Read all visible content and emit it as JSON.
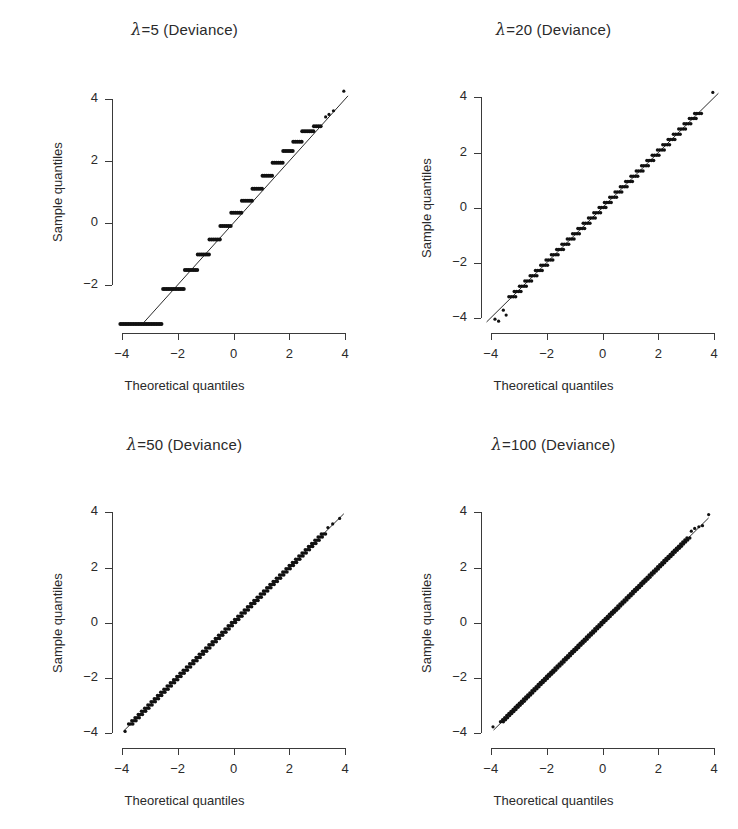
{
  "figure": {
    "width": 738,
    "height": 829,
    "background": "#ffffff",
    "ink": "#2a2a2a",
    "layout": "2x2 grid of normal Q-Q plots"
  },
  "axis_titles": {
    "x": "Theoretical quantiles",
    "y": "Sample quantiles"
  },
  "chart_data": [
    {
      "type": "scatter",
      "panel": 1,
      "title": "λ=5 (Deviance)",
      "lambda": 5,
      "residual_type": "Deviance",
      "xlabel": "Theoretical quantiles",
      "ylabel": "Sample quantiles",
      "xlim": [
        -4.35,
        4.35
      ],
      "ylim": [
        -3.55,
        4.45
      ],
      "xticks": [
        -4,
        -2,
        0,
        2,
        4
      ],
      "xticklabels": [
        "−4",
        "−2",
        "0",
        "2",
        "4"
      ],
      "yticks": [
        -2,
        0,
        2,
        4
      ],
      "yticklabels": [
        "−2",
        "0",
        "2",
        "4"
      ],
      "grid": false,
      "legend": false,
      "reference_line": {
        "type": "qq-line",
        "slope": 1.0,
        "intercept": 0.0,
        "x_from": -3.2,
        "x_to": 4.1
      },
      "discreteness": "very coarse - wide horizontal plateaus (few distinct residual values)",
      "plateaus": [
        {
          "y": -3.26,
          "x_from": -4.05,
          "x_to": -2.58
        },
        {
          "y": -2.13,
          "x_from": -2.52,
          "x_to": -1.78
        },
        {
          "y": -1.52,
          "x_from": -1.74,
          "x_to": -1.3
        },
        {
          "y": -1.02,
          "x_from": -1.28,
          "x_to": -0.88
        },
        {
          "y": -0.53,
          "x_from": -0.86,
          "x_to": -0.49
        },
        {
          "y": -0.1,
          "x_from": -0.47,
          "x_to": -0.1
        },
        {
          "y": 0.33,
          "x_from": -0.08,
          "x_to": 0.28
        },
        {
          "y": 0.72,
          "x_from": 0.3,
          "x_to": 0.66
        },
        {
          "y": 1.1,
          "x_from": 0.68,
          "x_to": 1.02
        },
        {
          "y": 1.52,
          "x_from": 1.04,
          "x_to": 1.38
        },
        {
          "y": 1.94,
          "x_from": 1.4,
          "x_to": 1.76
        },
        {
          "y": 2.32,
          "x_from": 1.78,
          "x_to": 2.12
        },
        {
          "y": 2.62,
          "x_from": 2.14,
          "x_to": 2.44
        },
        {
          "y": 2.96,
          "x_from": 2.46,
          "x_to": 2.86
        },
        {
          "y": 3.12,
          "x_from": 2.88,
          "x_to": 3.12
        }
      ],
      "outliers": [
        {
          "x": 3.3,
          "y": 3.42
        },
        {
          "x": 3.42,
          "y": 3.5
        },
        {
          "x": 3.58,
          "y": 3.62
        },
        {
          "x": 3.95,
          "y": 4.25
        }
      ]
    },
    {
      "type": "scatter",
      "panel": 2,
      "title": "λ=20 (Deviance)",
      "lambda": 20,
      "residual_type": "Deviance",
      "xlabel": "Theoretical quantiles",
      "ylabel": "Sample quantiles",
      "xlim": [
        -4.35,
        4.35
      ],
      "ylim": [
        -4.55,
        4.45
      ],
      "xticks": [
        -4,
        -2,
        0,
        2,
        4
      ],
      "xticklabels": [
        "−4",
        "−2",
        "0",
        "2",
        "4"
      ],
      "yticks": [
        -4,
        -2,
        0,
        2,
        4
      ],
      "yticklabels": [
        "−4",
        "−2",
        "0",
        "2",
        "4"
      ],
      "grid": false,
      "legend": false,
      "reference_line": {
        "type": "qq-line",
        "slope": 1.0,
        "intercept": 0.0,
        "x_from": -4.15,
        "x_to": 4.15
      },
      "discreteness": "moderate staircase - short horizontal plateaus along the line",
      "plateau_step": 0.19,
      "plateau_halfwidth": 0.12,
      "plateau_range": [
        -3.35,
        3.55
      ],
      "outliers": [
        {
          "x": -3.85,
          "y": -4.05
        },
        {
          "x": -3.72,
          "y": -4.12
        },
        {
          "x": -3.55,
          "y": -3.72
        },
        {
          "x": -3.45,
          "y": -3.9
        },
        {
          "x": 3.95,
          "y": 4.18
        }
      ]
    },
    {
      "type": "scatter",
      "panel": 3,
      "title": "λ=50 (Deviance)",
      "lambda": 50,
      "residual_type": "Deviance",
      "xlabel": "Theoretical quantiles",
      "ylabel": "Sample quantiles",
      "xlim": [
        -4.35,
        4.35
      ],
      "ylim": [
        -4.55,
        4.45
      ],
      "xticks": [
        -4,
        -2,
        0,
        2,
        4
      ],
      "xticklabels": [
        "−4",
        "−2",
        "0",
        "2",
        "4"
      ],
      "yticks": [
        -4,
        -2,
        0,
        2,
        4
      ],
      "yticklabels": [
        "−4",
        "−2",
        "0",
        "2",
        "4"
      ],
      "grid": false,
      "legend": false,
      "reference_line": {
        "type": "qq-line",
        "slope": 1.0,
        "intercept": 0.0,
        "x_from": -3.95,
        "x_to": 3.95
      },
      "discreteness": "fine staircase - nearly continuous",
      "plateau_step": 0.115,
      "plateau_halfwidth": 0.075,
      "plateau_range": [
        -3.7,
        3.25
      ],
      "outliers": [
        {
          "x": -3.88,
          "y": -3.95
        },
        {
          "x": 3.38,
          "y": 3.45
        },
        {
          "x": 3.55,
          "y": 3.58
        },
        {
          "x": 3.8,
          "y": 3.78
        }
      ]
    },
    {
      "type": "scatter",
      "panel": 4,
      "title": "λ=100 (Deviance)",
      "lambda": 100,
      "residual_type": "Deviance",
      "xlabel": "Theoretical quantiles",
      "ylabel": "Sample quantiles",
      "xlim": [
        -4.35,
        4.35
      ],
      "ylim": [
        -4.55,
        4.45
      ],
      "xticks": [
        -4,
        -2,
        0,
        2,
        4
      ],
      "xticklabels": [
        "−4",
        "−2",
        "0",
        "2",
        "4"
      ],
      "yticks": [
        -4,
        -2,
        0,
        2,
        4
      ],
      "yticklabels": [
        "−4",
        "−2",
        "0",
        "2",
        "4"
      ],
      "grid": false,
      "legend": false,
      "reference_line": {
        "type": "qq-line",
        "slope": 1.0,
        "intercept": 0.0,
        "x_from": -3.9,
        "x_to": 3.8
      },
      "discreteness": "very fine - essentially a continuous straight band",
      "plateau_step": 0.075,
      "plateau_halfwidth": 0.05,
      "plateau_range": [
        -3.65,
        3.1
      ],
      "outliers": [
        {
          "x": -3.92,
          "y": -3.78
        },
        {
          "x": 3.18,
          "y": 3.32
        },
        {
          "x": 3.3,
          "y": 3.42
        },
        {
          "x": 3.45,
          "y": 3.48
        },
        {
          "x": 3.58,
          "y": 3.52
        },
        {
          "x": 3.8,
          "y": 3.92
        }
      ]
    }
  ]
}
